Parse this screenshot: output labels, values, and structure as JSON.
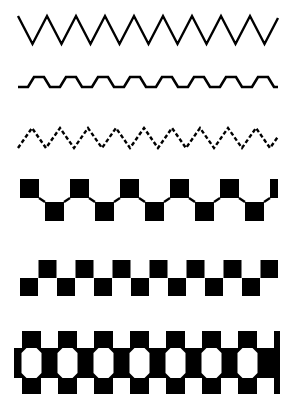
{
  "page": {
    "width": 287,
    "height": 400,
    "background_color": "#ffffff",
    "ink_color": "#000000"
  },
  "rows": [
    {
      "id": "row-1",
      "name": "tall-line-zigzag",
      "label": "Tall line zigzag",
      "kind": "zigzag-line",
      "y": 8,
      "height": 44,
      "x_start": 18,
      "x_end": 278,
      "amplitude": 28,
      "period": 29,
      "stroke_width": 2.4,
      "dash": "none",
      "phase_start": "down",
      "color": "#000000"
    },
    {
      "id": "row-2",
      "name": "low-zigzag-with-flats",
      "label": "Low zigzag with flat shoulders",
      "kind": "zigzag-line-flats",
      "y": 60,
      "height": 40,
      "x_start": 18,
      "x_end": 278,
      "amplitude": 10,
      "period": 32,
      "flat_length": 10,
      "stroke_width": 2.6,
      "dash": "none",
      "baseline_drift": 6,
      "color": "#000000"
    },
    {
      "id": "row-3",
      "name": "dashed-zigzag",
      "label": "Dashed small zigzag",
      "kind": "zigzag-line",
      "y": 118,
      "height": 40,
      "x_start": 18,
      "x_end": 278,
      "amplitude": 20,
      "period": 28,
      "stroke_width": 2.4,
      "dash": "4 2.4",
      "phase_start": "up",
      "color": "#000000"
    },
    {
      "id": "row-4",
      "name": "square-zigzag-linked",
      "label": "Alternating squares linked by diagonals",
      "kind": "squares-linked",
      "y": 178,
      "height": 52,
      "x_start": 20,
      "x_end": 278,
      "square_size": 19,
      "step_x": 25,
      "step_y": 23,
      "stroke_width": 2.2,
      "color": "#000000"
    },
    {
      "id": "row-5",
      "name": "checker-square-band",
      "label": "Offset checker square band",
      "kind": "squares-checker",
      "y": 258,
      "height": 44,
      "x_start": 20,
      "x_end": 278,
      "square_size": 18,
      "step_x": 18.5,
      "step_y": 18,
      "color": "#000000"
    },
    {
      "id": "row-6",
      "name": "octagon-hole-border-band",
      "label": "Solid band with octagon holes and tabs",
      "kind": "band-octagons",
      "y": 320,
      "height": 74,
      "x_start": 14,
      "x_end": 280,
      "band_top": 28,
      "band_height": 30,
      "tab_width": 19,
      "tab_height": 17,
      "octagon_width": 20,
      "octagon_height": 30,
      "octagon_chamfer": 5,
      "unit_width": 36,
      "color": "#000000",
      "hole_color": "#ffffff"
    }
  ]
}
